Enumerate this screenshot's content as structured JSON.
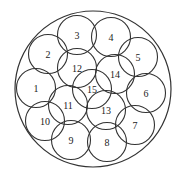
{
  "diagram": {
    "title": "",
    "stroke_color": "#333333",
    "background": "#ffffff",
    "outer_circle": {
      "cx": 93,
      "cy": 89,
      "r": 78
    },
    "circle_radius": 19.5,
    "circles": [
      {
        "label": "1",
        "cx": 36,
        "cy": 88
      },
      {
        "label": "2",
        "cx": 48,
        "cy": 54
      },
      {
        "label": "3",
        "cx": 77,
        "cy": 35
      },
      {
        "label": "4",
        "cx": 111,
        "cy": 37
      },
      {
        "label": "5",
        "cx": 138,
        "cy": 57
      },
      {
        "label": "6",
        "cx": 146,
        "cy": 93
      },
      {
        "label": "7",
        "cx": 135,
        "cy": 125
      },
      {
        "label": "8",
        "cx": 107,
        "cy": 142
      },
      {
        "label": "9",
        "cx": 71,
        "cy": 140
      },
      {
        "label": "10",
        "cx": 45,
        "cy": 121
      },
      {
        "label": "11",
        "cx": 68,
        "cy": 105
      },
      {
        "label": "12",
        "cx": 77,
        "cy": 68
      },
      {
        "label": "13",
        "cx": 106,
        "cy": 110
      },
      {
        "label": "14",
        "cx": 115,
        "cy": 74
      },
      {
        "label": "15",
        "cx": 92,
        "cy": 89
      }
    ]
  }
}
